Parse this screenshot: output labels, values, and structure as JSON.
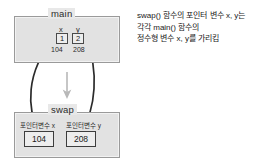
{
  "diagram": {
    "title_main": "main",
    "title_swap": "swap",
    "main_frame": {
      "variables": [
        {
          "name": "x",
          "value": "1",
          "address": "104"
        },
        {
          "name": "y",
          "value": "2",
          "address": "208"
        }
      ]
    },
    "swap_frame": {
      "pointers": [
        {
          "label": "포인터변수 x",
          "value": "104"
        },
        {
          "label": "포인터변수 y",
          "value": "208"
        }
      ]
    },
    "annotation": {
      "lines": [
        "swap() 함수의 포인터 변수 x, y는",
        "각각 main() 함수의",
        "정수형 변수 x, y를 가리킴"
      ]
    },
    "colors": {
      "frame_fill": "#e2e2e2",
      "frame_border": "#9a9a9a",
      "cell_border": "#4a4a4a",
      "arrow": "#2b2b2b",
      "call_arrow": "#b0b0b0",
      "text": "#1a1a1a"
    },
    "icons": {
      "call_flow": "down-arrow-icon",
      "pointer_link_x": "curved-arrow-up-icon",
      "pointer_link_y": "curved-arrow-up-icon"
    }
  }
}
